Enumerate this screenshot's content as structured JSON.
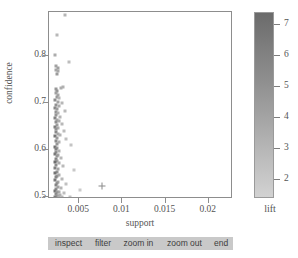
{
  "chart_data": {
    "type": "scatter",
    "title": "",
    "xlabel": "support",
    "ylabel": "confidence",
    "xlim": [
      0.0015,
      0.0228
    ],
    "ylim": [
      0.495,
      0.895
    ],
    "grid": false,
    "xticks": [
      "0.005",
      "0.01",
      "0.015",
      "0.02"
    ],
    "xtick_values": [
      0.005,
      0.01,
      0.015,
      0.02
    ],
    "yticks": [
      "0.5",
      "0.6",
      "0.7",
      "0.8"
    ],
    "ytick_values": [
      0.5,
      0.6,
      0.7,
      0.8
    ],
    "colorbar": {
      "label": "lift",
      "ticks": [
        "7",
        "6",
        "5",
        "4",
        "3",
        "2"
      ],
      "tick_values": [
        7,
        6,
        5,
        4,
        3,
        2
      ],
      "range": [
        1.4,
        7.4
      ],
      "low_color": "#d2d2d2",
      "high_color": "#6b6b6b",
      "orientation": "vertical"
    },
    "marker": "square",
    "selected_marker": "cross",
    "color_series_name": "lift",
    "points": [
      {
        "x": 0.00335,
        "y": 0.888,
        "lift": 3.1
      },
      {
        "x": 0.00243,
        "y": 0.845,
        "lift": 2.9
      },
      {
        "x": 0.00224,
        "y": 0.803,
        "lift": 3.6
      },
      {
        "x": 0.00376,
        "y": 0.788,
        "lift": 2.6
      },
      {
        "x": 0.00234,
        "y": 0.779,
        "lift": 4.2
      },
      {
        "x": 0.00249,
        "y": 0.776,
        "lift": 4.4
      },
      {
        "x": 0.00229,
        "y": 0.772,
        "lift": 4.0
      },
      {
        "x": 0.00256,
        "y": 0.769,
        "lift": 3.8
      },
      {
        "x": 0.00239,
        "y": 0.763,
        "lift": 4.6
      },
      {
        "x": 0.0031,
        "y": 0.735,
        "lift": 3.3
      },
      {
        "x": 0.0029,
        "y": 0.733,
        "lift": 3.5
      },
      {
        "x": 0.00231,
        "y": 0.73,
        "lift": 4.8
      },
      {
        "x": 0.00246,
        "y": 0.726,
        "lift": 5.0
      },
      {
        "x": 0.00226,
        "y": 0.722,
        "lift": 4.3
      },
      {
        "x": 0.00259,
        "y": 0.718,
        "lift": 3.9
      },
      {
        "x": 0.00239,
        "y": 0.714,
        "lift": 4.7
      },
      {
        "x": 0.00271,
        "y": 0.711,
        "lift": 3.2
      },
      {
        "x": 0.00224,
        "y": 0.707,
        "lift": 5.4
      },
      {
        "x": 0.0025,
        "y": 0.703,
        "lift": 4.1
      },
      {
        "x": 0.00302,
        "y": 0.7,
        "lift": 3.0
      },
      {
        "x": 0.00232,
        "y": 0.697,
        "lift": 5.1
      },
      {
        "x": 0.00262,
        "y": 0.694,
        "lift": 3.7
      },
      {
        "x": 0.00222,
        "y": 0.69,
        "lift": 5.8
      },
      {
        "x": 0.00244,
        "y": 0.687,
        "lift": 4.5
      },
      {
        "x": 0.0033,
        "y": 0.684,
        "lift": 2.8
      },
      {
        "x": 0.00228,
        "y": 0.681,
        "lift": 5.2
      },
      {
        "x": 0.00255,
        "y": 0.678,
        "lift": 3.4
      },
      {
        "x": 0.00236,
        "y": 0.674,
        "lift": 4.9
      },
      {
        "x": 0.00282,
        "y": 0.671,
        "lift": 3.1
      },
      {
        "x": 0.00221,
        "y": 0.668,
        "lift": 6.1
      },
      {
        "x": 0.00247,
        "y": 0.665,
        "lift": 4.0
      },
      {
        "x": 0.00266,
        "y": 0.662,
        "lift": 3.6
      },
      {
        "x": 0.00231,
        "y": 0.659,
        "lift": 5.3
      },
      {
        "x": 0.00298,
        "y": 0.656,
        "lift": 2.9
      },
      {
        "x": 0.00241,
        "y": 0.653,
        "lift": 4.4
      },
      {
        "x": 0.00224,
        "y": 0.65,
        "lift": 6.4
      },
      {
        "x": 0.00259,
        "y": 0.647,
        "lift": 3.5
      },
      {
        "x": 0.00234,
        "y": 0.644,
        "lift": 5.0
      },
      {
        "x": 0.00318,
        "y": 0.641,
        "lift": 2.7
      },
      {
        "x": 0.00227,
        "y": 0.638,
        "lift": 5.7
      },
      {
        "x": 0.0025,
        "y": 0.635,
        "lift": 3.9
      },
      {
        "x": 0.00276,
        "y": 0.632,
        "lift": 3.2
      },
      {
        "x": 0.00222,
        "y": 0.629,
        "lift": 6.8
      },
      {
        "x": 0.00243,
        "y": 0.626,
        "lift": 4.6
      },
      {
        "x": 0.00352,
        "y": 0.623,
        "lift": 2.5
      },
      {
        "x": 0.0023,
        "y": 0.62,
        "lift": 5.5
      },
      {
        "x": 0.00264,
        "y": 0.617,
        "lift": 3.4
      },
      {
        "x": 0.00238,
        "y": 0.613,
        "lift": 4.8
      },
      {
        "x": 0.00403,
        "y": 0.61,
        "lift": 2.2
      },
      {
        "x": 0.00221,
        "y": 0.607,
        "lift": 7.1
      },
      {
        "x": 0.00248,
        "y": 0.604,
        "lift": 4.2
      },
      {
        "x": 0.00226,
        "y": 0.601,
        "lift": 6.0
      },
      {
        "x": 0.00271,
        "y": 0.598,
        "lift": 3.3
      },
      {
        "x": 0.00235,
        "y": 0.595,
        "lift": 5.1
      },
      {
        "x": 0.00223,
        "y": 0.592,
        "lift": 6.6
      },
      {
        "x": 0.00255,
        "y": 0.589,
        "lift": 3.8
      },
      {
        "x": 0.0024,
        "y": 0.586,
        "lift": 4.7
      },
      {
        "x": 0.0029,
        "y": 0.583,
        "lift": 3.0
      },
      {
        "x": 0.00228,
        "y": 0.58,
        "lift": 5.9
      },
      {
        "x": 0.00246,
        "y": 0.577,
        "lift": 4.3
      },
      {
        "x": 0.0022,
        "y": 0.574,
        "lift": 7.3
      },
      {
        "x": 0.00262,
        "y": 0.571,
        "lift": 3.6
      },
      {
        "x": 0.00233,
        "y": 0.568,
        "lift": 5.4
      },
      {
        "x": 0.0031,
        "y": 0.565,
        "lift": 2.8
      },
      {
        "x": 0.00225,
        "y": 0.562,
        "lift": 6.2
      },
      {
        "x": 0.00252,
        "y": 0.559,
        "lift": 4.0
      },
      {
        "x": 0.0044,
        "y": 0.556,
        "lift": 2.0
      },
      {
        "x": 0.00237,
        "y": 0.553,
        "lift": 5.0
      },
      {
        "x": 0.00221,
        "y": 0.55,
        "lift": 6.9
      },
      {
        "x": 0.00268,
        "y": 0.547,
        "lift": 3.5
      },
      {
        "x": 0.00243,
        "y": 0.544,
        "lift": 4.5
      },
      {
        "x": 0.00229,
        "y": 0.541,
        "lift": 5.8
      },
      {
        "x": 0.003,
        "y": 0.538,
        "lift": 2.9
      },
      {
        "x": 0.00223,
        "y": 0.535,
        "lift": 6.5
      },
      {
        "x": 0.00257,
        "y": 0.532,
        "lift": 3.7
      },
      {
        "x": 0.00239,
        "y": 0.529,
        "lift": 4.9
      },
      {
        "x": 0.00345,
        "y": 0.527,
        "lift": 2.4
      },
      {
        "x": 0.00227,
        "y": 0.524,
        "lift": 6.0
      },
      {
        "x": 0.00249,
        "y": 0.521,
        "lift": 4.1
      },
      {
        "x": 0.00285,
        "y": 0.519,
        "lift": 3.1
      },
      {
        "x": 0.00234,
        "y": 0.517,
        "lift": 5.2
      },
      {
        "x": 0.00505,
        "y": 0.515,
        "lift": 1.8
      },
      {
        "x": 0.00221,
        "y": 0.513,
        "lift": 7.0
      },
      {
        "x": 0.00261,
        "y": 0.511,
        "lift": 3.6
      },
      {
        "x": 0.00242,
        "y": 0.509,
        "lift": 4.6
      },
      {
        "x": 0.00326,
        "y": 0.507,
        "lift": 2.6
      },
      {
        "x": 0.0023,
        "y": 0.505,
        "lift": 5.6
      },
      {
        "x": 0.00275,
        "y": 0.503,
        "lift": 3.3
      },
      {
        "x": 0.00254,
        "y": 0.502,
        "lift": 3.9
      },
      {
        "x": 0.00237,
        "y": 0.501,
        "lift": 4.8
      },
      {
        "x": 0.00396,
        "y": 0.5,
        "lift": 2.3
      },
      {
        "x": 0.00222,
        "y": 0.5,
        "lift": 6.3
      },
      {
        "x": 0.00302,
        "y": 0.5,
        "lift": 2.9
      },
      {
        "x": 0.00264,
        "y": 0.499,
        "lift": 3.4
      }
    ],
    "selected_points": [
      {
        "x": 0.0076,
        "y": 0.523,
        "lift": 1.6
      }
    ]
  },
  "toolbar": {
    "buttons": [
      {
        "label": "inspect",
        "name": "inspect-button"
      },
      {
        "label": "filter",
        "name": "filter-button"
      },
      {
        "label": "zoom in",
        "name": "zoom-in-button"
      },
      {
        "label": "zoom out",
        "name": "zoom-out-button"
      },
      {
        "label": "end",
        "name": "end-button"
      }
    ]
  }
}
